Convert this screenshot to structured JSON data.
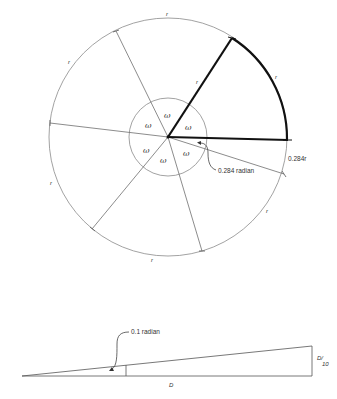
{
  "figure": {
    "type": "geometry-diagram",
    "top": {
      "description": "Circle divided into sectors by radii, illustrating the radian",
      "outer_circle": {
        "cx": 168,
        "cy": 137,
        "r": 119
      },
      "inner_circle": {
        "cx": 168,
        "cy": 137,
        "r": 39
      },
      "arc_labels": [
        {
          "text": "r",
          "x": 166,
          "y": 16
        },
        {
          "text": "r",
          "x": 68,
          "y": 64
        },
        {
          "text": "r",
          "x": 50,
          "y": 185
        },
        {
          "text": "r",
          "x": 151,
          "y": 262
        },
        {
          "text": "r",
          "x": 266,
          "y": 213
        },
        {
          "text": "r",
          "x": 275,
          "y": 79
        }
      ],
      "radius_label": {
        "text": "r",
        "x": 196,
        "y": 84
      },
      "omega_labels": [
        {
          "text": "ω",
          "x": 164,
          "y": 118
        },
        {
          "text": "ω",
          "x": 145,
          "y": 128
        },
        {
          "text": "ω",
          "x": 185,
          "y": 130
        },
        {
          "text": "ω",
          "x": 143,
          "y": 153
        },
        {
          "text": "ω",
          "x": 160,
          "y": 163
        },
        {
          "text": "ω",
          "x": 183,
          "y": 156
        }
      ],
      "angle_label": "0.284 radian",
      "remainder_label": "0.284r"
    },
    "bottom": {
      "description": "Thin triangle illustrating a 0.1 radian angle",
      "angle_label": "0.1 radian",
      "base_label": "D",
      "height_label_numerator": "D/",
      "height_label_denominator": "10"
    }
  }
}
